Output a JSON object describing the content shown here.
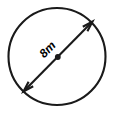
{
  "figure": {
    "shape": "circle",
    "background_color": "#ffffff",
    "stroke_color": "#1a1a1a",
    "label_color": "#000000",
    "canvas": {
      "width": 116,
      "height": 113
    },
    "circle": {
      "center_x": 57,
      "center_y": 56.5,
      "radius": 48.5,
      "stroke_width": 2.1
    },
    "diameter": {
      "label": "8m",
      "value": 8,
      "unit": "m",
      "measure_type": "diameter",
      "label_x": 48,
      "label_y": 50,
      "label_rotation": -46,
      "label_font_size": 12,
      "start_x": 23.5,
      "start_y": 91.5,
      "end_x": 92.5,
      "end_y": 21.5,
      "stroke_width": 2.1,
      "arrowhead_length": 11,
      "arrowhead_half_angle": 17
    },
    "center_point": {
      "x": 57.8,
      "y": 57,
      "radius": 2.9
    }
  },
  "chart_data": {
    "type": "diagram",
    "shape": "circle",
    "annotations": [
      {
        "name": "diameter-measure",
        "text": "8m",
        "value": 8,
        "unit": "m",
        "type": "double-headed-arrow",
        "from": [
          23.5,
          91.5
        ],
        "to": [
          92.5,
          21.5
        ]
      },
      {
        "name": "center-point",
        "text": "",
        "type": "dot",
        "at": [
          57.8,
          57
        ]
      }
    ],
    "xlabel": "",
    "ylabel": "",
    "grid": false,
    "legend": false
  }
}
